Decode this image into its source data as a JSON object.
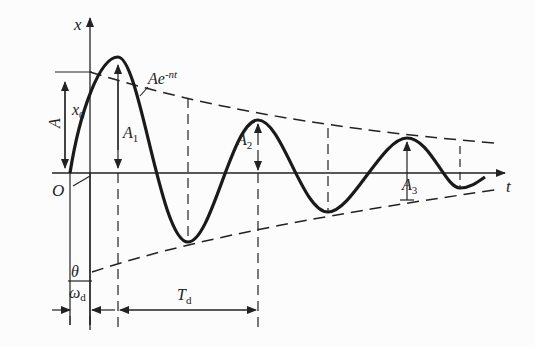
{
  "diagram": {
    "type": "damped-oscillation-plot",
    "axes": {
      "x_label": "t",
      "y_label": "x",
      "origin_label": "O"
    },
    "envelope_label": "Ae",
    "envelope_exp": "-nt",
    "labels": {
      "amplitude": "A",
      "initial_displacement": "x",
      "initial_displacement_sub": "0",
      "A1": "A",
      "A1_sub": "1",
      "A2": "A",
      "A2_sub": "2",
      "A3": "A",
      "A3_sub": "3",
      "phase_num": "θ",
      "phase_den": "ω",
      "phase_den_sub": "d",
      "period": "T",
      "period_sub": "d"
    },
    "colors": {
      "curve": "#1a1a1a",
      "lines": "#222222",
      "background": "#fcfcfc"
    }
  }
}
